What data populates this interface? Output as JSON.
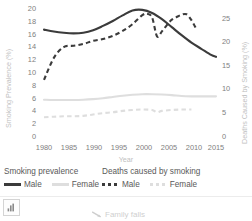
{
  "chart_data": {
    "type": "line",
    "title": "",
    "xlabel": "Year",
    "ylabel": "Smoking Prevalence (%)",
    "y2label": "Deaths Caused by Smoking (%)",
    "xlim": [
      1978,
      2017
    ],
    "ylim": [
      0,
      20.8
    ],
    "y2lim": [
      0,
      28.6
    ],
    "grid": false,
    "legend_position": "below",
    "xticks": [
      "1980",
      "1985",
      "1990",
      "1995",
      "2000",
      "2005",
      "2010",
      "2015"
    ],
    "xtick_values": [
      1980,
      1985,
      1990,
      1995,
      2000,
      2005,
      2010,
      2015
    ],
    "yticks": [
      "0",
      "2",
      "4",
      "6",
      "8",
      "10",
      "12",
      "14",
      "16",
      "18",
      "20"
    ],
    "ytick_values": [
      0,
      2,
      4,
      6,
      8,
      10,
      12,
      14,
      16,
      18,
      20
    ],
    "y2ticks": [
      "0",
      "5",
      "10",
      "15",
      "20",
      "25"
    ],
    "y2tick_values": [
      0,
      5,
      10,
      15,
      20,
      25
    ],
    "series": [
      {
        "name": "Smoking prevalence — Male",
        "axis": "left",
        "style": "solid",
        "color": "#3b3b3b",
        "x": [
          1980,
          1982,
          1984,
          1986,
          1988,
          1990,
          1992,
          1994,
          1996,
          1998,
          2000,
          2002,
          2004,
          2006,
          2008,
          2010,
          2012,
          2014,
          2015
        ],
        "values": [
          17.3,
          17.0,
          16.8,
          16.7,
          16.8,
          17.2,
          17.9,
          18.7,
          19.6,
          20.4,
          20.5,
          20.0,
          19.0,
          17.7,
          16.4,
          15.2,
          14.2,
          13.2,
          12.9
        ]
      },
      {
        "name": "Smoking prevalence — Female",
        "axis": "left",
        "style": "solid",
        "color": "#dedede",
        "x": [
          1980,
          1982,
          1984,
          1986,
          1988,
          1990,
          1992,
          1994,
          1996,
          1998,
          2000,
          2002,
          2004,
          2006,
          2008,
          2010,
          2012,
          2014,
          2015
        ],
        "values": [
          5.95,
          5.9,
          5.9,
          5.9,
          5.95,
          6.05,
          6.2,
          6.4,
          6.6,
          6.75,
          6.85,
          6.85,
          6.8,
          6.7,
          6.55,
          6.5,
          6.5,
          6.5,
          6.5
        ]
      },
      {
        "name": "Deaths caused by smoking — Male",
        "axis": "right",
        "style": "dashed",
        "color": "#3b3b3b",
        "x": [
          1980,
          1982,
          1984,
          1986,
          1988,
          1990,
          1992,
          1994,
          1996,
          1998,
          2000,
          2001,
          2002,
          2003,
          2004,
          2005,
          2006,
          2007,
          2008,
          2009,
          2010,
          2011
        ],
        "values": [
          12.6,
          17.5,
          19.9,
          20.2,
          20.6,
          21.3,
          21.7,
          22.4,
          23.5,
          25.0,
          27.0,
          27.3,
          26.5,
          22.3,
          23.4,
          24.8,
          26.0,
          26.6,
          27.1,
          27.2,
          25.9,
          23.9
        ]
      },
      {
        "name": "Deaths caused by smoking — Female",
        "axis": "right",
        "style": "dashed",
        "color": "#dedede",
        "x": [
          1980,
          1982,
          1984,
          1986,
          1988,
          1990,
          1992,
          1994,
          1996,
          1998,
          2000,
          2002,
          2003,
          2004,
          2006,
          2008,
          2010
        ],
        "values": [
          4.3,
          4.4,
          4.5,
          4.5,
          4.6,
          4.9,
          5.2,
          5.4,
          5.7,
          5.9,
          6.0,
          5.9,
          5.4,
          5.7,
          5.9,
          6.0,
          6.0
        ]
      }
    ]
  },
  "legend": {
    "groups": [
      {
        "heading": "Smoking prevalence",
        "entries": [
          {
            "label": "Male",
            "swatch": "solid-dark"
          },
          {
            "label": "Female",
            "swatch": "solid-light"
          }
        ]
      },
      {
        "heading": "Deaths caused by smoking",
        "entries": [
          {
            "label": "Male",
            "swatch": "dash-dark"
          },
          {
            "label": "Female",
            "swatch": "dash-light"
          }
        ]
      }
    ]
  },
  "toolbar": {
    "chart_icon_name": "bar-chart-icon"
  },
  "caption": {
    "text": "Family falls",
    "icon_name": "arrow-pointer-icon"
  }
}
